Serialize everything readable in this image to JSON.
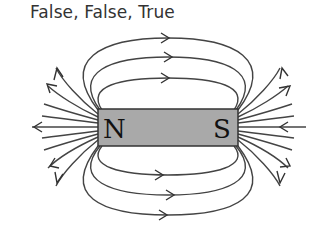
{
  "caption": "False, False, True",
  "diagram": {
    "type": "bar-magnet-field-lines",
    "magnet": {
      "north_label": "N",
      "south_label": "S",
      "fill_color": "#a9a9a9",
      "outline_color": "#333333"
    },
    "field_line_color": "#444444",
    "field_direction": "from N to S outside the magnet",
    "top_loops": 3,
    "bottom_loops": 3,
    "side_lines_each_end": 8
  }
}
